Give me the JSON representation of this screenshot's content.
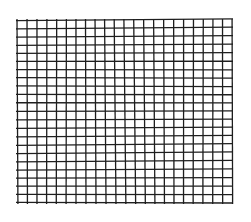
{
  "figure": {
    "type": "grid",
    "background_color": "#ffffff",
    "line_color": "#1e1e1e",
    "line_width": 1.3,
    "columns": 22,
    "rows": 22,
    "bounds": {
      "left": 17,
      "top": 20,
      "right": 232,
      "bottom": 203
    }
  }
}
